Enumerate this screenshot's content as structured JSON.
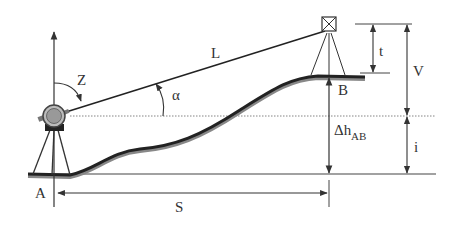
{
  "diagram": {
    "colors": {
      "line": "#333333",
      "terrain": "#2a2a2a",
      "terrain_shadow": "#888888",
      "instrument_body": "#9a9a9a",
      "dotted": "#777777"
    },
    "labels": {
      "zenith_angle": "Z",
      "slope_distance": "L",
      "vertical_angle": "α",
      "target_height": "t",
      "vertical_difference": "V",
      "height_difference_symbol": "Δh",
      "height_difference_subscript": "AB",
      "instrument_height": "i",
      "point_a": "A",
      "point_b": "B",
      "horizontal_distance": "S"
    },
    "elements": [
      {
        "id": "total-station",
        "at": "A",
        "type": "instrument on tripod"
      },
      {
        "id": "target-prism",
        "at": "B",
        "type": "target on tripod"
      },
      {
        "id": "terrain-profile",
        "from": "A",
        "to": "B"
      }
    ]
  }
}
